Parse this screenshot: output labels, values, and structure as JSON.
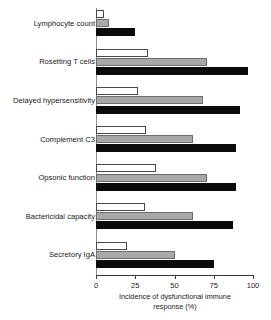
{
  "chart_data": {
    "type": "bar",
    "orientation": "horizontal",
    "title": "",
    "xlabel": "Incidence of dysfunctional immune response (%)",
    "xlabel_line1": "Incidence of dysfunctional immune",
    "xlabel_line2": "response (%)",
    "ylabel": "",
    "xlim": [
      0,
      100
    ],
    "xticks": [
      0,
      25,
      50,
      75,
      100
    ],
    "xtick_labels": [
      "0",
      "25",
      "50",
      "75",
      "100"
    ],
    "grid": false,
    "legend": "none",
    "categories": [
      "Lymphocyte count",
      "Rosetting T cells",
      "Delayed hypersensitivity",
      "Complement C3",
      "Opsonic function",
      "Bactericidal capacity",
      "Secretory IgA"
    ],
    "series": [
      {
        "name": "white",
        "style": "open-outline",
        "color": "#ffffff",
        "values": [
          5,
          33,
          27,
          32,
          38,
          31,
          20
        ]
      },
      {
        "name": "gray",
        "style": "filled-gray",
        "color": "#a8a8a8",
        "values": [
          8,
          71,
          68,
          62,
          71,
          62,
          50
        ]
      },
      {
        "name": "black",
        "style": "filled-black",
        "color": "#0b0b0b",
        "values": [
          25,
          97,
          92,
          89,
          89,
          87,
          75
        ]
      }
    ]
  },
  "colors": {
    "axis": "#3b3b3b",
    "baseline": "#8d8d8d",
    "text": "#1a1a1a",
    "background": "#ffffff"
  }
}
